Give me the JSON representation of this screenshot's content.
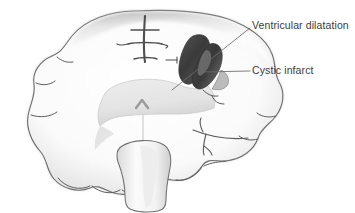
{
  "figure": {
    "type": "medical-illustration",
    "background_color": "#ffffff",
    "width": 355,
    "height": 213
  },
  "annotations": [
    {
      "id": "ventricular-dilatation",
      "label": "Ventricular dilatation",
      "text_color": "#3b3b3b",
      "leader_line": {
        "x1": 250,
        "y1": 28,
        "x2": 172,
        "y2": 90
      }
    },
    {
      "id": "cystic-infarct",
      "label": "Cystic infarct",
      "text_color": "#3b3b3b",
      "leader_line": {
        "x1": 250,
        "y1": 71,
        "x2": 203,
        "y2": 72
      }
    }
  ],
  "structures": {
    "cortex_label": "Cerebral cortex",
    "deep_grey_label": "Deep grey matter",
    "lesion_label": "Cystic infarct cavity",
    "ventricle_label": "Dilated lateral ventricle",
    "brainstem_label": "Brainstem",
    "fissure_label": "Interhemispheric fissure"
  },
  "colors": {
    "background": "#ffffff",
    "outline": "#6f6f6f",
    "outline_dark": "#4a4a4a",
    "parenchyma_light": "#fdfdfd",
    "parenchyma_shadow": "#c8c8c8",
    "deep_grey": "#e6e6e6",
    "deep_grey_edge": "#c9c9c9",
    "lesion_dark": "#3c3c3c",
    "lesion_mid": "#5a5a5a",
    "lesion_light": "#8d8d8d",
    "sulcus_line": "#4f4f4f",
    "leader_line": "#6a6a6a"
  }
}
